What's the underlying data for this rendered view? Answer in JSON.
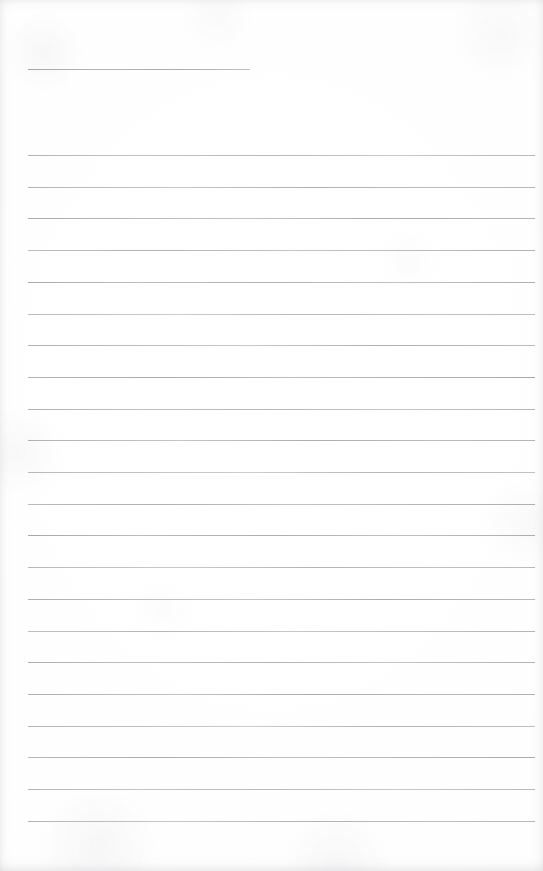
{
  "document": {
    "kind": "lined-writing-paper-scan",
    "title": "Blank ruled notebook page",
    "page_width": 543,
    "page_height": 871,
    "background_color": "#fefefe",
    "edge_tint_color": "#f6f6f7",
    "content_text": "",
    "has_visible_text": false
  },
  "header_rule": {
    "label": "title rule",
    "x": 28,
    "y": 69,
    "width": 222,
    "color": "#a6a6ad"
  },
  "ruling": {
    "label": "body ruled lines",
    "line_color": "#adadb3",
    "line_thickness": 1,
    "left_margin": 28,
    "right_edge": 535,
    "line_width": 507,
    "first_line_y": 155,
    "line_spacing": 31.7,
    "line_count": 22,
    "line_y_positions": [
      155,
      186.7,
      218.4,
      250.1,
      281.8,
      313.5,
      345.2,
      376.9,
      408.6,
      440.3,
      472.0,
      503.7,
      535.4,
      567.1,
      598.8,
      630.5,
      662.2,
      693.9,
      725.6,
      757.3,
      789.0,
      820.7
    ]
  }
}
